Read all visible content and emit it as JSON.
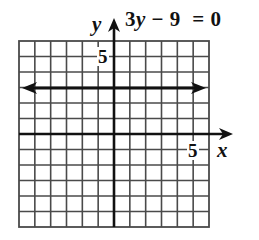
{
  "title": "3y − 9 = 0",
  "equation": {
    "coef": "3",
    "var": "y",
    "rest": " − 9  = 0"
  },
  "axes": {
    "x_label": "x",
    "y_label": "y",
    "x_tick_label": "5",
    "y_tick_label": "5"
  },
  "colors": {
    "grid": "#4a4a4a",
    "axis": "#111111",
    "line": "#111111",
    "background": "#ffffff"
  },
  "chart_data": {
    "type": "line",
    "title": "3y − 9 = 0",
    "xlabel": "x",
    "ylabel": "y",
    "xlim": [
      -6,
      6
    ],
    "ylim": [
      -6,
      6
    ],
    "grid": true,
    "grid_step": 1,
    "labeled_ticks": {
      "x": [
        5
      ],
      "y": [
        5
      ]
    },
    "series": [
      {
        "name": "3y - 9 = 0 (y = 3)",
        "x": [
          -5.8,
          5.8
        ],
        "y": [
          3,
          3
        ],
        "arrows": "both"
      }
    ],
    "legend": "none"
  }
}
